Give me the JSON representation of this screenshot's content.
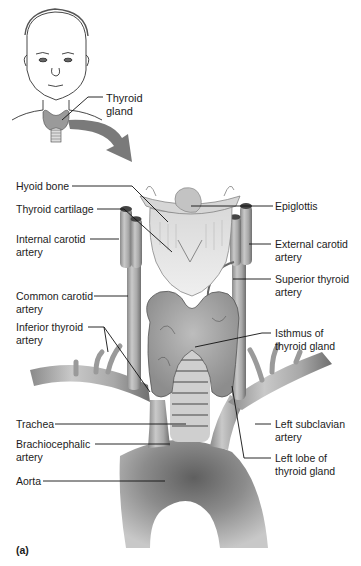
{
  "figure": {
    "panel_label": "(a)",
    "inset": {
      "label": "Thyroid\ngland"
    },
    "labels_left": [
      {
        "id": "hyoid-bone",
        "text": "Hyoid bone"
      },
      {
        "id": "thyroid-cartilage",
        "text": "Thyroid cartilage"
      },
      {
        "id": "internal-carotid-artery",
        "text": "Internal carotid\nartery"
      },
      {
        "id": "common-carotid-artery",
        "text": "Common carotid\nartery"
      },
      {
        "id": "inferior-thyroid-artery",
        "text": "Inferior thyroid\nartery"
      },
      {
        "id": "trachea",
        "text": "Trachea"
      },
      {
        "id": "brachiocephalic-artery",
        "text": "Brachiocephalic\nartery"
      },
      {
        "id": "aorta",
        "text": "Aorta"
      }
    ],
    "labels_right": [
      {
        "id": "epiglottis",
        "text": "Epiglottis"
      },
      {
        "id": "external-carotid-artery",
        "text": "External carotid\nartery"
      },
      {
        "id": "superior-thyroid-artery",
        "text": "Superior thyroid\nartery"
      },
      {
        "id": "isthmus-of-thyroid-gland",
        "text": "Isthmus of\nthyroid gland"
      },
      {
        "id": "left-subclavian-artery",
        "text": "Left subclavian\nartery"
      },
      {
        "id": "left-lobe-of-thyroid-gland",
        "text": "Left lobe of\nthyroid gland"
      }
    ]
  }
}
